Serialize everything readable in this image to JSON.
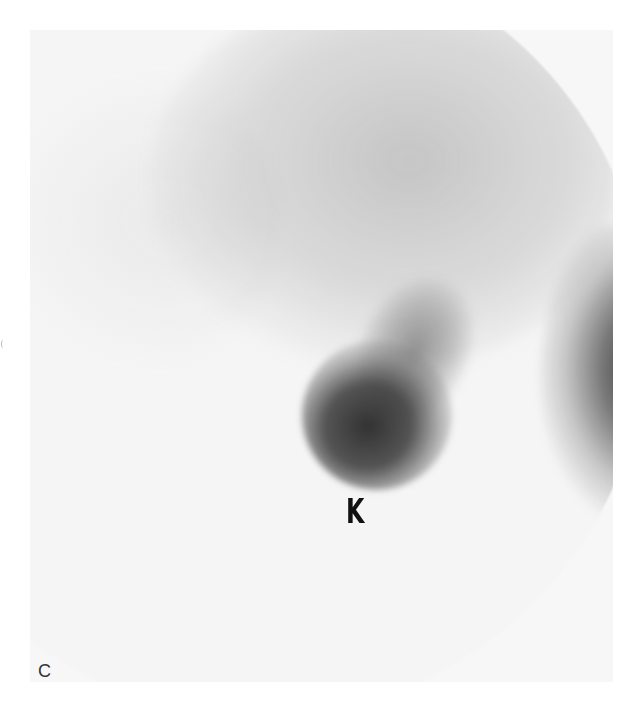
{
  "figure": {
    "panel_label": "C",
    "image_type": "grayscale scintigraphy scan",
    "annotations": [
      {
        "text": "K",
        "meaning": "kidney",
        "position": "below dark focal uptake, center"
      }
    ],
    "regions": [
      {
        "name": "diffuse-upper-uptake",
        "tone": "light gray"
      },
      {
        "name": "kidney-uptake",
        "tone": "dark gray"
      },
      {
        "name": "right-edge-uptake",
        "tone": "dark gray"
      }
    ],
    "colors": {
      "background": "#ffffff",
      "field": "#f5f5f5",
      "dense_uptake": "#282828",
      "label": "#111111"
    }
  }
}
